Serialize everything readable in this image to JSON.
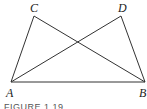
{
  "figure": {
    "caption": "FIGURE 1.19",
    "line_color": "#333333",
    "points": {
      "A": {
        "label": "A",
        "x": 11,
        "y": 82
      },
      "B": {
        "label": "B",
        "x": 145,
        "y": 82
      },
      "C": {
        "label": "C",
        "x": 34,
        "y": 16
      },
      "D": {
        "label": "D",
        "x": 121,
        "y": 16
      }
    },
    "segments": [
      [
        "A",
        "B"
      ],
      [
        "A",
        "C"
      ],
      [
        "A",
        "D"
      ],
      [
        "B",
        "C"
      ],
      [
        "B",
        "D"
      ]
    ]
  }
}
